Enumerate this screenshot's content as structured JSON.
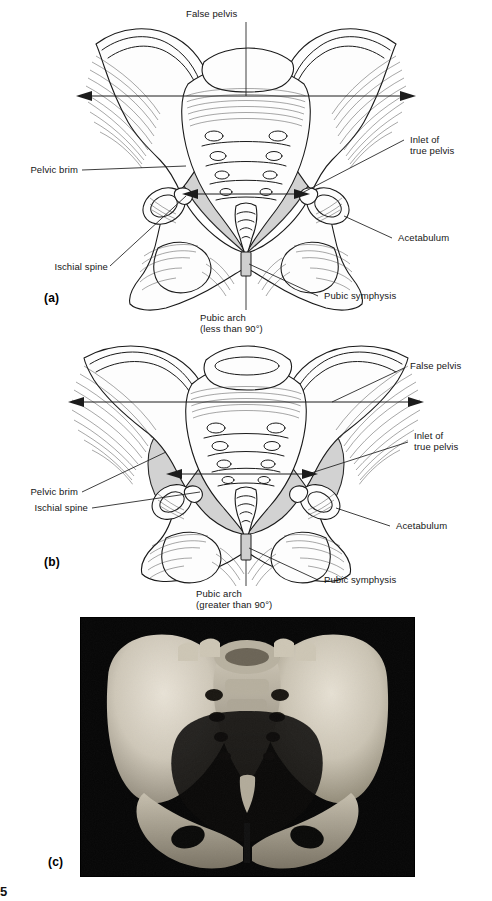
{
  "figure": {
    "page_number": "5",
    "colors": {
      "inlet_shade": "#d2d2d2",
      "line": "#1a1a1a",
      "photo_background": "#000000",
      "bone_light": "#fdfdfd"
    },
    "panels": [
      {
        "letter": "(a)",
        "kind": "male-pelvis-illustration",
        "labels": [
          {
            "id": "false-pelvis",
            "text": "False pelvis"
          },
          {
            "id": "inlet-true-pelvis",
            "text": "Inlet of\ntrue pelvis"
          },
          {
            "id": "acetabulum",
            "text": "Acetabulum"
          },
          {
            "id": "pubic-symphysis",
            "text": "Pubic symphysis"
          },
          {
            "id": "pubic-arch",
            "text": "Pubic arch\n(less than 90°)"
          },
          {
            "id": "ischial-spine",
            "text": "Ischial spine"
          },
          {
            "id": "pelvic-brim",
            "text": "Pelvic brim"
          }
        ]
      },
      {
        "letter": "(b)",
        "kind": "female-pelvis-illustration",
        "labels": [
          {
            "id": "false-pelvis",
            "text": "False pelvis"
          },
          {
            "id": "inlet-true-pelvis",
            "text": "Inlet of\ntrue pelvis"
          },
          {
            "id": "acetabulum",
            "text": "Acetabulum"
          },
          {
            "id": "pubic-symphysis",
            "text": "Pubic symphysis"
          },
          {
            "id": "pubic-arch",
            "text": "Pubic arch\n(greater than 90°)"
          },
          {
            "id": "ischial-spine",
            "text": "Ischial spine"
          },
          {
            "id": "pelvic-brim",
            "text": "Pelvic brim"
          }
        ]
      },
      {
        "letter": "(c)",
        "kind": "pelvis-photograph",
        "labels": []
      }
    ],
    "label_text": {
      "a_false_pelvis": "False pelvis",
      "a_inlet_line1": "Inlet of",
      "a_inlet_line2": "true pelvis",
      "a_acetabulum": "Acetabulum",
      "a_pubic_symphysis": "Pubic symphysis",
      "a_pubic_arch_line1": "Pubic arch",
      "a_pubic_arch_line2": "(less than 90°)",
      "a_ischial_spine": "Ischial spine",
      "a_pelvic_brim": "Pelvic brim",
      "a_letter": "(a)",
      "b_false_pelvis": "False pelvis",
      "b_inlet_line1": "Inlet of",
      "b_inlet_line2": "true pelvis",
      "b_acetabulum": "Acetabulum",
      "b_pubic_symphysis": "Pubic symphysis",
      "b_pubic_arch_line1": "Pubic arch",
      "b_pubic_arch_line2": "(greater than 90°)",
      "b_ischial_spine": "Ischial spine",
      "b_pelvic_brim": "Pelvic brim",
      "b_letter": "(b)",
      "c_letter": "(c)"
    }
  }
}
